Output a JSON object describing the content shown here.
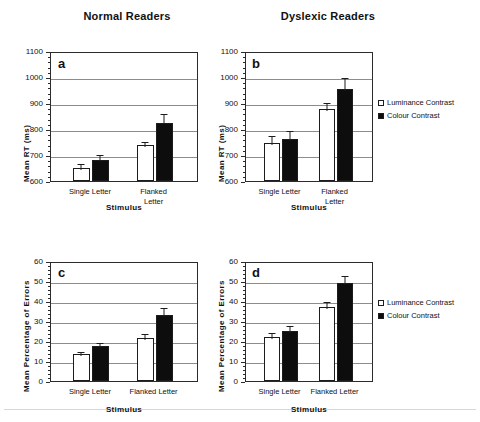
{
  "titles": {
    "normal": "Normal Readers",
    "dyslexic": "Dyslexic Readers"
  },
  "legend": {
    "luminance": "Luminance Contrast",
    "colour": "Colour Contrast"
  },
  "axis_titles": {
    "rt": "Mean RT (ms)",
    "errors": "Mean Percentage of Errors",
    "stimulus": "Stimulus"
  },
  "panel_letters": {
    "a": "a",
    "b": "b",
    "c": "c",
    "d": "d"
  },
  "categories": {
    "single": "Single Letter",
    "flanked_one_line": "Flanked Letter",
    "flanked_line1": "Flanked",
    "flanked_line2": "Letter"
  },
  "rt_ticks": [
    "1100",
    "1000",
    "900",
    "800",
    "700",
    "600"
  ],
  "error_ticks": [
    "60",
    "50",
    "40",
    "30",
    "20",
    "10",
    "0"
  ],
  "chart_data": [
    {
      "id": "a",
      "type": "bar",
      "title": "Normal Readers",
      "panel_label": "a",
      "xlabel": "Stimulus",
      "ylabel": "Mean RT (ms)",
      "ylim": [
        600,
        1100
      ],
      "ytick_step": 100,
      "grid": true,
      "legend_position": "none",
      "categories": [
        "Single Letter",
        "Flanked Letter"
      ],
      "series": [
        {
          "name": "Luminance Contrast",
          "values": [
            650,
            738
          ],
          "errors": [
            22,
            20
          ]
        },
        {
          "name": "Colour Contrast",
          "values": [
            681,
            825
          ],
          "errors": [
            27,
            42
          ]
        }
      ]
    },
    {
      "id": "b",
      "type": "bar",
      "title": "Dyslexic Readers",
      "panel_label": "b",
      "xlabel": "Stimulus",
      "ylabel": "Mean RT (ms)",
      "ylim": [
        600,
        1100
      ],
      "ytick_step": 100,
      "grid": true,
      "legend_position": "right",
      "categories": [
        "Single Letter",
        "Flanked Letter"
      ],
      "series": [
        {
          "name": "Luminance Contrast",
          "values": [
            748,
            878
          ],
          "errors": [
            32,
            30
          ]
        },
        {
          "name": "Colour Contrast",
          "values": [
            760,
            953
          ],
          "errors": [
            40,
            52
          ]
        }
      ]
    },
    {
      "id": "c",
      "type": "bar",
      "title": "Normal Readers",
      "panel_label": "c",
      "xlabel": "Stimulus",
      "ylabel": "Mean Percentage of Errors",
      "ylim": [
        0,
        60
      ],
      "ytick_step": 10,
      "grid": true,
      "legend_position": "none",
      "categories": [
        "Single Letter",
        "Flanked Letter"
      ],
      "series": [
        {
          "name": "Luminance Contrast",
          "values": [
            13.5,
            21.5
          ],
          "errors": [
            2.2,
            3.0
          ]
        },
        {
          "name": "Colour Contrast",
          "values": [
            17.5,
            33.0
          ],
          "errors": [
            2.5,
            4.5
          ]
        }
      ]
    },
    {
      "id": "d",
      "type": "bar",
      "title": "Dyslexic Readers",
      "panel_label": "d",
      "xlabel": "Stimulus",
      "ylabel": "Mean Percentage of Errors",
      "ylim": [
        0,
        60
      ],
      "ytick_step": 10,
      "grid": true,
      "legend_position": "right",
      "categories": [
        "Single Letter",
        "Flanked Letter"
      ],
      "series": [
        {
          "name": "Luminance Contrast",
          "values": [
            22.0,
            37.0
          ],
          "errors": [
            3.0,
            3.5
          ]
        },
        {
          "name": "Colour Contrast",
          "values": [
            25.0,
            49.0
          ],
          "errors": [
            3.5,
            4.5
          ]
        }
      ]
    }
  ]
}
